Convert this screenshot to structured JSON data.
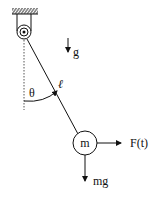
{
  "diagram": {
    "labels": {
      "gravity": "g",
      "angle": "θ",
      "length": "ℓ",
      "mass": "m",
      "force": "F(t)",
      "weight": "mg"
    },
    "colors": {
      "stroke": "#111111",
      "dashed": "#555555",
      "background": "#ffffff"
    },
    "icons": {
      "ceiling": "hatched-ceiling-icon",
      "pivot": "pulley-pivot-icon",
      "gravity_arrow": "arrow-down-icon",
      "force_arrow": "arrow-right-icon",
      "weight_arrow": "arrow-down-icon"
    }
  }
}
